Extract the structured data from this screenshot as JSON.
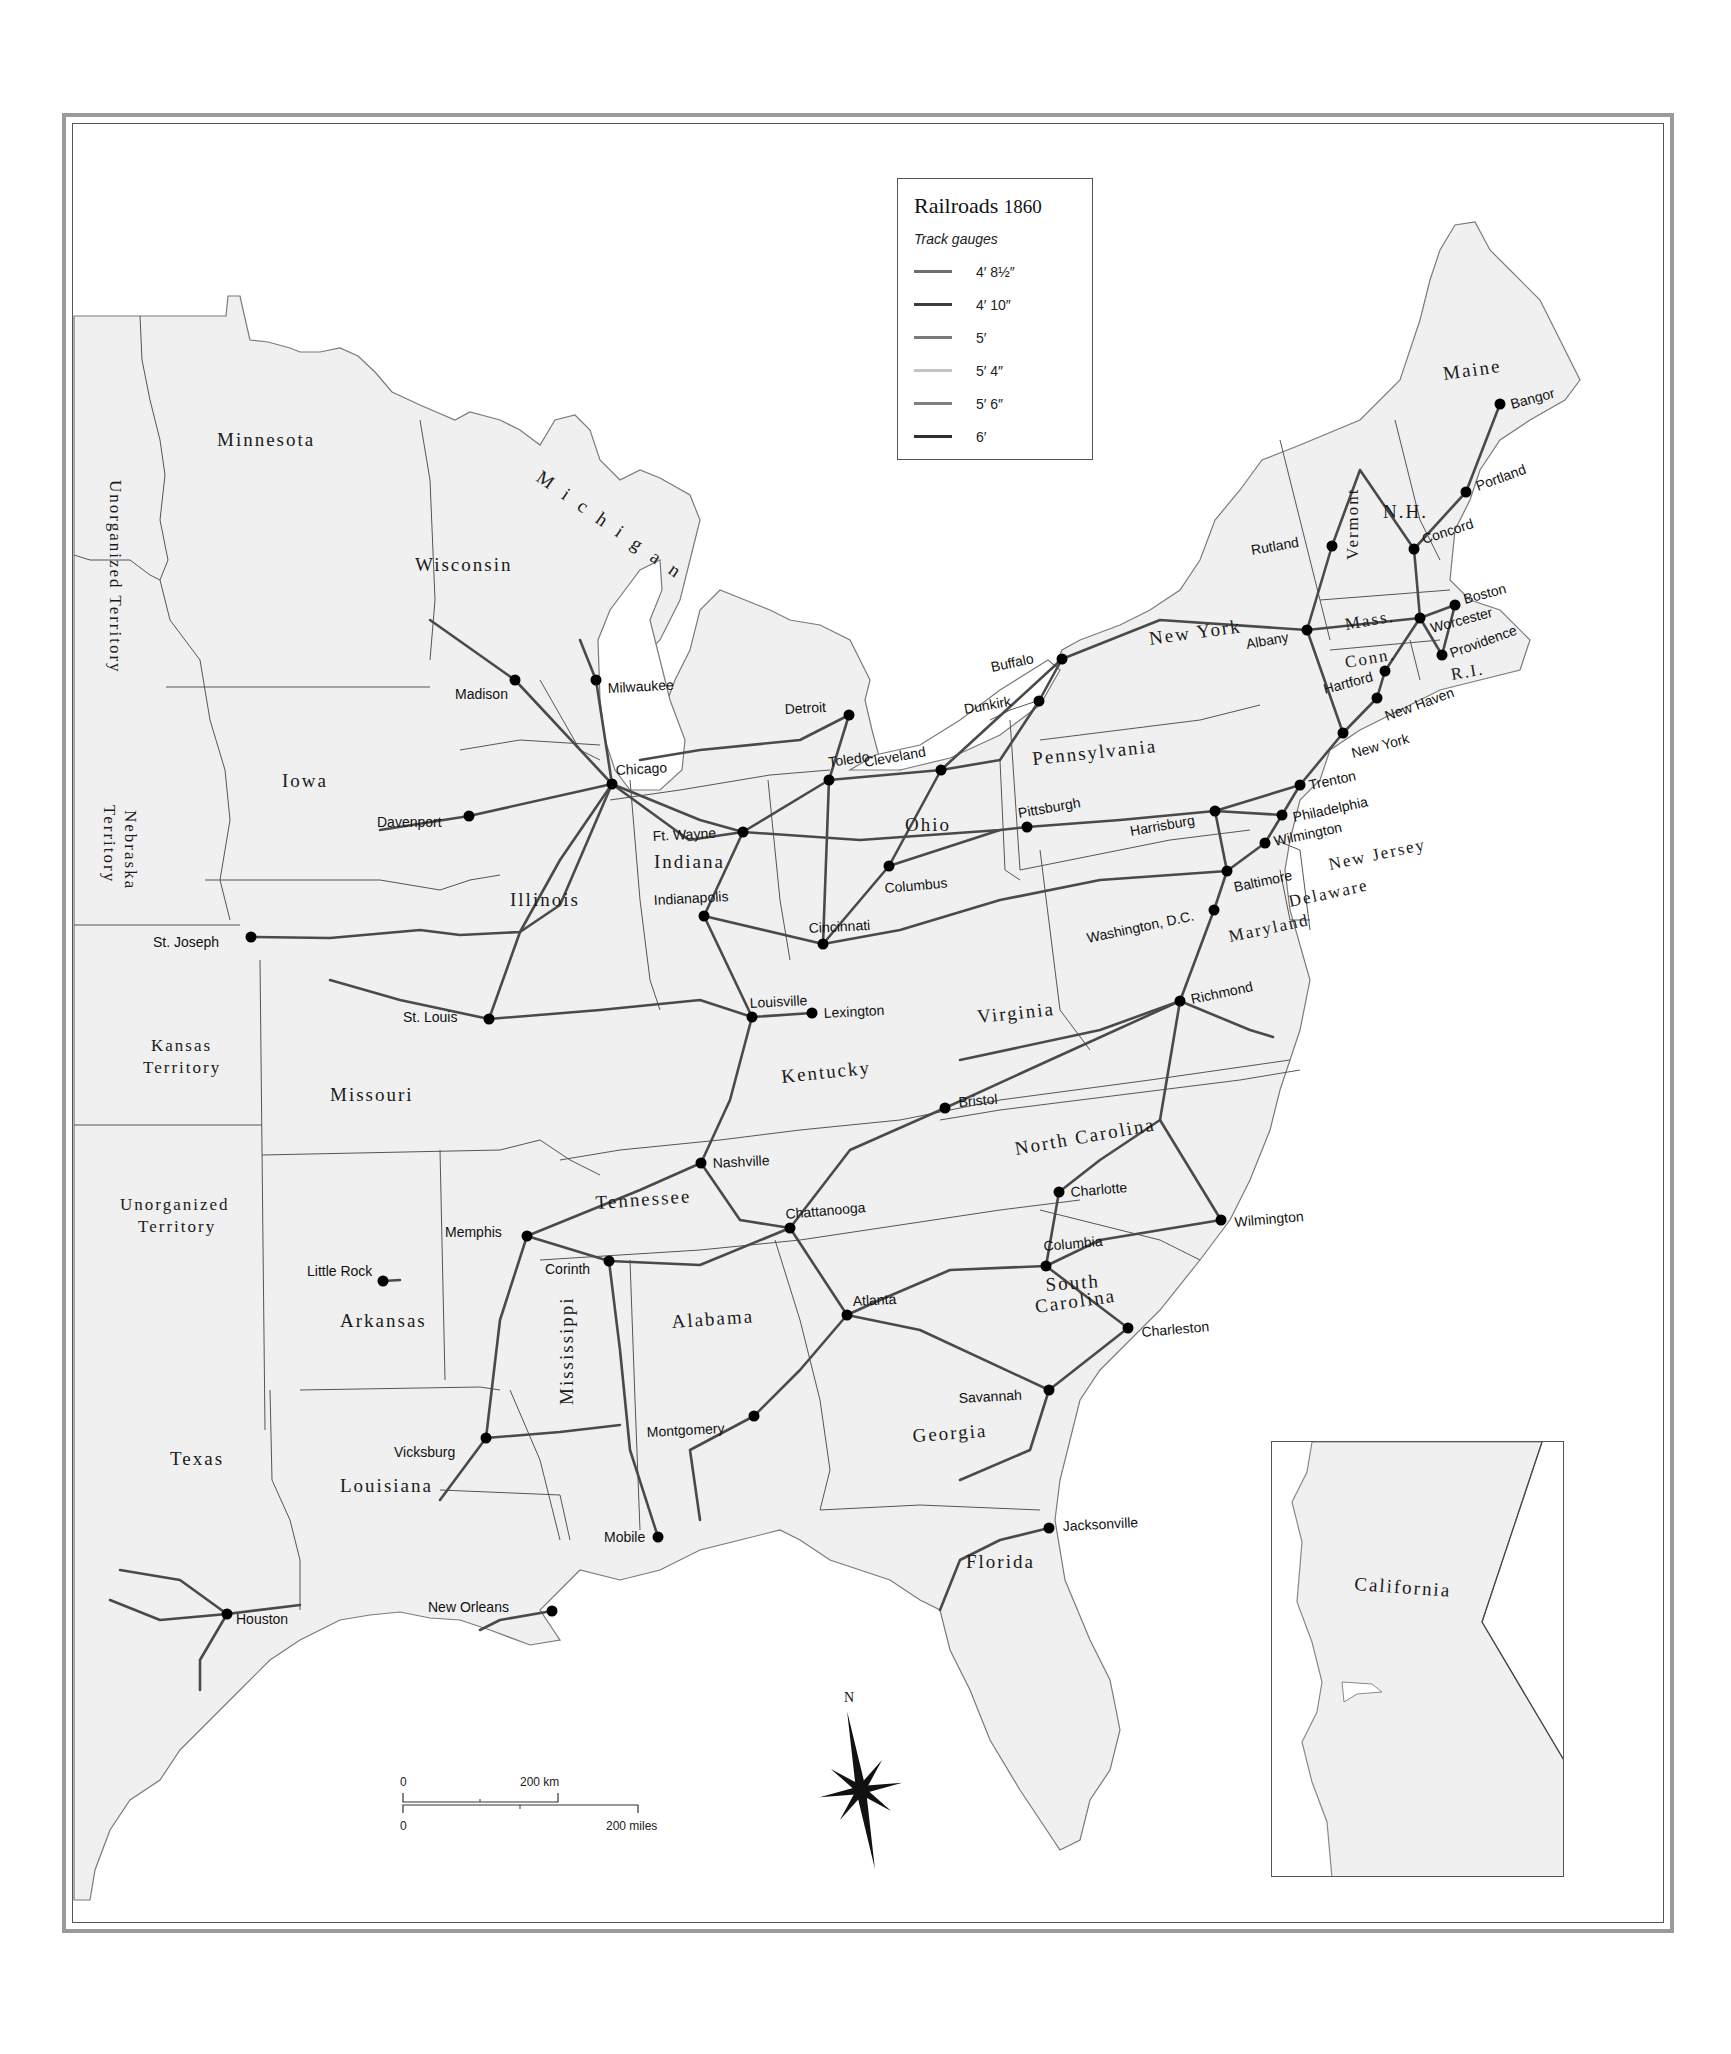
{
  "map": {
    "title": "Railroads",
    "year": "1860",
    "legend": {
      "subtitle": "Track gauges",
      "items": [
        {
          "label": "4′ 8½″",
          "color": "#6e6e6e"
        },
        {
          "label": "4′ 10″",
          "color": "#3c3c3c"
        },
        {
          "label": "5′",
          "color": "#7a7a7a"
        },
        {
          "label": "5′ 4″",
          "color": "#c4c4c4"
        },
        {
          "label": "5′ 6″",
          "color": "#808080"
        },
        {
          "label": "6′",
          "color": "#2e2e2e"
        }
      ]
    },
    "scale_bar": {
      "km_start": "0",
      "km_end": "200 km",
      "mi_start": "0",
      "mi_end": "200 miles"
    },
    "compass": {
      "north_label": "N"
    },
    "water_labels": {
      "lake_michigan": "Michigan"
    },
    "states": {
      "minnesota": "Minnesota",
      "wisconsin": "Wisconsin",
      "iowa": "Iowa",
      "illinois": "Illinois",
      "indiana": "Indiana",
      "ohio": "Ohio",
      "pennsylvania": "Pennsylvania",
      "new_york": "New York",
      "vermont": "Vermont",
      "nh": "N.H.",
      "maine": "Maine",
      "mass": "Mass.",
      "conn": "Conn.",
      "ri": "R.I.",
      "new_jersey": "New Jersey",
      "delaware": "Delaware",
      "maryland": "Maryland",
      "virginia": "Virginia",
      "kentucky": "Kentucky",
      "tennessee": "Tennessee",
      "north_carolina": "North Carolina",
      "south_carolina_1": "South",
      "south_carolina_2": "Carolina",
      "georgia": "Georgia",
      "florida": "Florida",
      "alabama": "Alabama",
      "mississippi": "Mississippi",
      "louisiana": "Louisiana",
      "arkansas": "Arkansas",
      "missouri": "Missouri",
      "texas": "Texas",
      "kansas_1": "Kansas",
      "kansas_2": "Territory",
      "nebraska_1": "Nebraska",
      "nebraska_2": "Territory",
      "unorg_north": "Unorganized Territory",
      "unorg_south_1": "Unorganized",
      "unorg_south_2": "Territory",
      "california": "California"
    },
    "cities": [
      {
        "name": "Bangor",
        "x": 1500,
        "y": 404,
        "lx": 12,
        "ly": 0,
        "rot": -15
      },
      {
        "name": "Portland",
        "x": 1466,
        "y": 492,
        "lx": 12,
        "ly": -6,
        "rot": -20
      },
      {
        "name": "Concord",
        "x": 1414,
        "y": 549,
        "lx": 10,
        "ly": -10,
        "rot": -18
      },
      {
        "name": "Rutland",
        "x": 1332,
        "y": 546,
        "lx": -80,
        "ly": 4,
        "rot": -10
      },
      {
        "name": "Boston",
        "x": 1455,
        "y": 605,
        "lx": 10,
        "ly": -6,
        "rot": -15
      },
      {
        "name": "Worcester",
        "x": 1420,
        "y": 618,
        "lx": 12,
        "ly": 10,
        "rot": -15
      },
      {
        "name": "Albany",
        "x": 1307,
        "y": 630,
        "lx": -60,
        "ly": 14,
        "rot": -10
      },
      {
        "name": "Providence",
        "x": 1442,
        "y": 655,
        "lx": 10,
        "ly": -2,
        "rot": -20
      },
      {
        "name": "Hartford",
        "x": 1385,
        "y": 671,
        "lx": -60,
        "ly": 18,
        "rot": -15
      },
      {
        "name": "New Haven",
        "x": 1377,
        "y": 698,
        "lx": 10,
        "ly": 18,
        "rot": -20
      },
      {
        "name": "New York",
        "x": 1343,
        "y": 733,
        "lx": 10,
        "ly": 20,
        "rot": -15
      },
      {
        "name": "Buffalo",
        "x": 1062,
        "y": 659,
        "lx": -70,
        "ly": 8,
        "rot": -12
      },
      {
        "name": "Dunkirk",
        "x": 1039,
        "y": 701,
        "lx": -74,
        "ly": 8,
        "rot": -10
      },
      {
        "name": "Trenton",
        "x": 1300,
        "y": 785,
        "lx": 10,
        "ly": 0,
        "rot": -12
      },
      {
        "name": "Philadelphia",
        "x": 1282,
        "y": 815,
        "lx": 12,
        "ly": 2,
        "rot": -12
      },
      {
        "name": "Wilmington",
        "x": 1265,
        "y": 843,
        "lx": 10,
        "ly": -2,
        "rot": -12
      },
      {
        "name": "Harrisburg",
        "x": 1215,
        "y": 811,
        "lx": -84,
        "ly": 20,
        "rot": -10
      },
      {
        "name": "Pittsburgh",
        "x": 1027,
        "y": 827,
        "lx": -8,
        "ly": -14,
        "rot": -10
      },
      {
        "name": "Baltimore",
        "x": 1227,
        "y": 871,
        "lx": 8,
        "ly": 16,
        "rot": -12
      },
      {
        "name": "Washington, D.C.",
        "x": 1214,
        "y": 910,
        "lx": -126,
        "ly": 28,
        "rot": -12
      },
      {
        "name": "Richmond",
        "x": 1180,
        "y": 1001,
        "lx": 12,
        "ly": -2,
        "rot": -12
      },
      {
        "name": "Bristol",
        "x": 945,
        "y": 1108,
        "lx": 14,
        "ly": -6,
        "rot": -5
      },
      {
        "name": "Charlotte",
        "x": 1059,
        "y": 1192,
        "lx": 12,
        "ly": 0,
        "rot": -5
      },
      {
        "name": "Wilmington",
        "x": 1221,
        "y": 1220,
        "lx": 14,
        "ly": 2,
        "rot": -5
      },
      {
        "name": "Columbia",
        "x": 1046,
        "y": 1266,
        "lx": -2,
        "ly": -20,
        "rot": -5
      },
      {
        "name": "Charleston",
        "x": 1128,
        "y": 1328,
        "lx": 14,
        "ly": 4,
        "rot": -5
      },
      {
        "name": "Atlanta",
        "x": 847,
        "y": 1315,
        "lx": 6,
        "ly": -14,
        "rot": -3
      },
      {
        "name": "Savannah",
        "x": 1049,
        "y": 1390,
        "lx": -90,
        "ly": 8,
        "rot": -3
      },
      {
        "name": "Jacksonville",
        "x": 1049,
        "y": 1528,
        "lx": 14,
        "ly": -2,
        "rot": -3
      },
      {
        "name": "Montgomery",
        "x": 754,
        "y": 1416,
        "lx": -107,
        "ly": 16,
        "rot": -3
      },
      {
        "name": "Mobile",
        "x": 658,
        "y": 1537,
        "lx": -54,
        "ly": 0,
        "rot": 0
      },
      {
        "name": "New Orleans",
        "x": 552,
        "y": 1611,
        "lx": -124,
        "ly": -4,
        "rot": 0
      },
      {
        "name": "Houston",
        "x": 227,
        "y": 1614,
        "lx": 9,
        "ly": 5,
        "rot": 0
      },
      {
        "name": "Vicksburg",
        "x": 486,
        "y": 1438,
        "lx": -92,
        "ly": 14,
        "rot": 0
      },
      {
        "name": "Memphis",
        "x": 527,
        "y": 1236,
        "lx": -82,
        "ly": -4,
        "rot": 0
      },
      {
        "name": "Corinth",
        "x": 609,
        "y": 1261,
        "lx": -64,
        "ly": 8,
        "rot": 0
      },
      {
        "name": "Nashville",
        "x": 701,
        "y": 1163,
        "lx": 12,
        "ly": 0,
        "rot": -3
      },
      {
        "name": "Chattanooga",
        "x": 790,
        "y": 1228,
        "lx": -4,
        "ly": -14,
        "rot": -5
      },
      {
        "name": "Little Rock",
        "x": 383,
        "y": 1281,
        "lx": -76,
        "ly": -10,
        "rot": 0
      },
      {
        "name": "Louisville",
        "x": 752,
        "y": 1017,
        "lx": -2,
        "ly": -14,
        "rot": -3
      },
      {
        "name": "Lexington",
        "x": 812,
        "y": 1013,
        "lx": 12,
        "ly": 0,
        "rot": -3
      },
      {
        "name": "Cincinnati",
        "x": 823,
        "y": 944,
        "lx": -14,
        "ly": -16,
        "rot": -3
      },
      {
        "name": "Columbus",
        "x": 889,
        "y": 866,
        "lx": -4,
        "ly": 22,
        "rot": -5
      },
      {
        "name": "Indianapolis",
        "x": 704,
        "y": 916,
        "lx": -50,
        "ly": -16,
        "rot": -3
      },
      {
        "name": "Ft. Wayne",
        "x": 743,
        "y": 832,
        "lx": -90,
        "ly": 4,
        "rot": -3
      },
      {
        "name": "Toledo",
        "x": 829,
        "y": 780,
        "lx": 0,
        "ly": -18,
        "rot": -8
      },
      {
        "name": "Cleveland",
        "x": 941,
        "y": 770,
        "lx": -76,
        "ly": -8,
        "rot": -10
      },
      {
        "name": "Detroit",
        "x": 849,
        "y": 715,
        "lx": -64,
        "ly": -6,
        "rot": -3
      },
      {
        "name": "Chicago",
        "x": 612,
        "y": 784,
        "lx": 4,
        "ly": -14,
        "rot": -3
      },
      {
        "name": "Milwaukee",
        "x": 596,
        "y": 680,
        "lx": 12,
        "ly": 8,
        "rot": -3
      },
      {
        "name": "Madison",
        "x": 515,
        "y": 680,
        "lx": -60,
        "ly": 14,
        "rot": 0
      },
      {
        "name": "Davenport",
        "x": 469,
        "y": 816,
        "lx": -92,
        "ly": 6,
        "rot": 0
      },
      {
        "name": "St. Joseph",
        "x": 251,
        "y": 937,
        "lx": -98,
        "ly": 5,
        "rot": 0
      },
      {
        "name": "St. Louis",
        "x": 489,
        "y": 1019,
        "lx": -86,
        "ly": -2,
        "rot": 0
      },
      {
        "name": "Sacramento",
        "x": 1431,
        "y": 1653,
        "lx": -30,
        "ly": 24,
        "rot": 3
      }
    ]
  }
}
